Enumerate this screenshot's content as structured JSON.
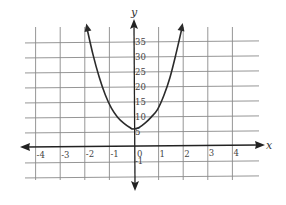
{
  "chart_data": {
    "type": "line",
    "title": "",
    "xlabel": "x",
    "ylabel": "y",
    "xlim": [
      -4.5,
      4.8
    ],
    "ylim": [
      -10,
      40
    ],
    "grid": true,
    "legend": null,
    "x_ticks": [
      -4,
      -3,
      -2,
      -1,
      0,
      1,
      2,
      3,
      4
    ],
    "x_tick_labels": [
      "-4",
      "-3",
      "-2",
      "-1",
      "0",
      "1",
      "2",
      "3",
      "4"
    ],
    "y_ticks": [
      -5,
      5,
      10,
      15,
      20,
      25,
      30,
      35
    ],
    "y_tick_labels": [
      "-1",
      "5",
      "10",
      "15",
      "20",
      "25",
      "30",
      "35"
    ],
    "y_grid_step": 5,
    "series": [
      {
        "name": "parabola-like curve",
        "arrows_at_ends": true,
        "x": [
          -2.0,
          -1.75,
          -1.5,
          -1.25,
          -1.0,
          -0.75,
          -0.5,
          -0.25,
          0.0,
          0.25,
          0.5,
          0.75,
          1.0,
          1.25,
          1.5,
          1.75,
          2.0
        ],
        "y": [
          40,
          31,
          23.5,
          17.5,
          13,
          10,
          8,
          6.5,
          6,
          6.5,
          8,
          10,
          12.5,
          17,
          23,
          31,
          40
        ]
      }
    ],
    "vertex": [
      0,
      6
    ]
  },
  "labels": {
    "x_axis": "x",
    "y_axis": "y"
  }
}
